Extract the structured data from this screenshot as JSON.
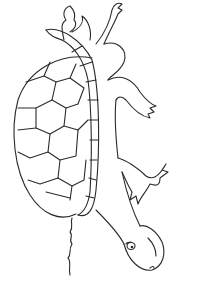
{
  "image": {
    "subject": "turtle coloring page line drawing",
    "background_color": "#ffffff",
    "line_color": "#2a2a2a"
  }
}
